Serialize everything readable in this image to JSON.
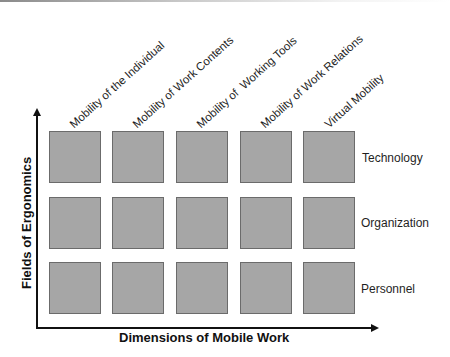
{
  "diagram": {
    "type": "matrix",
    "x_axis_title": "Dimensions of Mobile Work",
    "y_axis_title": "Fields of Ergonomics",
    "columns": [
      {
        "label": "Mobility of the Individual"
      },
      {
        "label": "Mobility of Work Contents"
      },
      {
        "label": "Mobility of  Working Tools"
      },
      {
        "label": "Mobility of Work Relations"
      },
      {
        "label": "Virtual Mobility"
      }
    ],
    "rows": [
      {
        "label": "Technology"
      },
      {
        "label": "Organization"
      },
      {
        "label": "Personnel"
      }
    ],
    "colors": {
      "cell_fill": "#a6a6a6",
      "cell_border": "#6b6b6b",
      "axis": "#111111",
      "background": "#ffffff"
    }
  }
}
